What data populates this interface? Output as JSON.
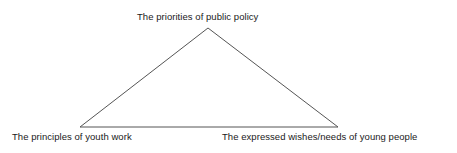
{
  "diagram": {
    "type": "triangle-relationship-diagram",
    "shape": {
      "name": "triangle",
      "stroke_color": "#555555",
      "stroke_width": 1,
      "fill": "none",
      "vertices": {
        "apex": {
          "x": 208,
          "y": 28
        },
        "bottom_left": {
          "x": 80,
          "y": 127
        },
        "bottom_right": {
          "x": 338,
          "y": 127
        }
      }
    },
    "labels": {
      "apex": "The priorities of public policy",
      "bottom_left": "The principles of youth work",
      "bottom_right": "The expressed wishes/needs of young people"
    }
  },
  "canvas": {
    "background_color": "#ffffff",
    "text_color": "#1a1a1a",
    "width": 457,
    "height": 153
  }
}
